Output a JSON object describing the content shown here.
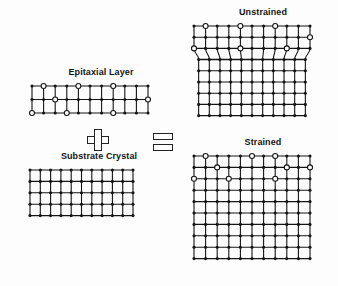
{
  "figure": {
    "background_color": "#fdfdfd",
    "ink_color": "#141414",
    "atom_fill_color": "#141414",
    "atom_open_color": "#ffffff"
  },
  "labels": {
    "epitaxial_layer": "Epitaxial Layer",
    "substrate_crystal": "Substrate Crystal",
    "unstrained": "Unstrained",
    "strained": "Strained"
  },
  "operators": {
    "plus": "+",
    "equals": "="
  },
  "chart_data": {
    "type": "diagram",
    "panels": [
      {
        "name": "epitaxial-layer",
        "label": "Epitaxial Layer",
        "x": 34,
        "y": 83,
        "cols": 11,
        "rows": 3,
        "dx": 11.6,
        "dy": 13.5,
        "bond_color": "#141414",
        "open_atoms": [
          [
            1,
            0
          ],
          [
            4,
            0
          ],
          [
            7,
            0
          ],
          [
            2,
            1
          ],
          [
            10,
            1
          ],
          [
            0,
            2
          ],
          [
            3,
            2
          ],
          [
            7,
            2
          ]
        ],
        "note": "wider lattice constant, open circles mark larger epitaxial atoms"
      },
      {
        "name": "substrate-crystal",
        "label": "Substrate Crystal",
        "x": 36,
        "y": 168,
        "cols": 11,
        "rows": 5,
        "dx": 10.3,
        "dy": 11.4,
        "bond_color": "#141414",
        "open_atoms": [],
        "note": "uniform grid, all filled atoms, smaller lattice constant"
      },
      {
        "name": "unstrained",
        "label": "Unstrained",
        "x": 196,
        "y": 26,
        "cols": 11,
        "rows": 9,
        "dx": 11.6,
        "dy": 11.2,
        "interface_row": 3,
        "bond_color": "#141414",
        "open_atoms": [
          [
            1,
            0
          ],
          [
            4,
            0
          ],
          [
            7,
            0
          ],
          [
            10,
            1
          ],
          [
            0,
            2
          ],
          [
            4,
            2
          ],
          [
            8,
            2
          ]
        ],
        "note": "epilayer keeps its own spacing; vertical bonds kink and curve at the interface forming misfit dislocations"
      },
      {
        "name": "strained",
        "label": "Strained",
        "x": 196,
        "y": 156,
        "cols": 11,
        "rows": 10,
        "dx": 11.6,
        "dy": 11.4,
        "interface_row": 3,
        "bond_color": "#141414",
        "open_atoms": [
          [
            1,
            0
          ],
          [
            5,
            0
          ],
          [
            7,
            0
          ],
          [
            2,
            1
          ],
          [
            8,
            1
          ],
          [
            10,
            1
          ],
          [
            0,
            2
          ],
          [
            3,
            2
          ],
          [
            7,
            2
          ]
        ],
        "note": "epilayer compressed to match substrate; vertical bonds remain straight and continuous"
      }
    ],
    "operators": [
      {
        "name": "plus",
        "symbol": "+",
        "x": 87,
        "y": 131
      },
      {
        "name": "equals",
        "symbol": "=",
        "x": 154,
        "y": 133
      }
    ]
  }
}
